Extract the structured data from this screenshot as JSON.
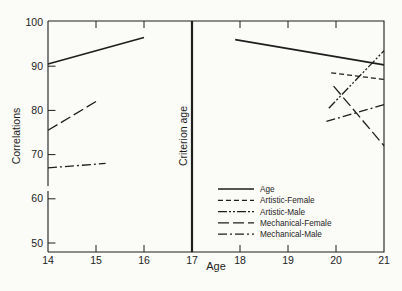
{
  "figure": {
    "background_color": "#fbfbf7",
    "line_color": "#1e1e1e"
  },
  "chart_data": {
    "type": "line",
    "title": "",
    "xlabel": "Age",
    "ylabel": "Correlations",
    "xlim": [
      14,
      21
    ],
    "ylim": [
      50,
      100
    ],
    "x_ticks": [
      14,
      15,
      16,
      17,
      18,
      19,
      20,
      21
    ],
    "y_ticks": [
      50,
      60,
      70,
      80,
      90,
      100
    ],
    "grid": false,
    "y_axis_break": true,
    "criterion_line": {
      "x": 17,
      "label": "Criterion age"
    },
    "legend": {
      "position": "inside-bottom-right",
      "entries": [
        "Age",
        "Artistic-Female",
        "Artistic-Male",
        "Mechanical-Female",
        "Mechanical-Male"
      ]
    },
    "series": [
      {
        "name": "Age",
        "line_style": "solid",
        "segments": [
          [
            [
              14,
              90.5
            ],
            [
              16,
              96.5
            ]
          ],
          [
            [
              17.9,
              96.0
            ],
            [
              21,
              90.3
            ]
          ]
        ]
      },
      {
        "name": "Artistic-Female",
        "line_style": "dashed",
        "segments": [
          [
            [
              19.9,
              88.5
            ],
            [
              21,
              87.0
            ]
          ]
        ]
      },
      {
        "name": "Artistic-Male",
        "line_style": "dash-dot-dot",
        "segments": [
          [
            [
              19.85,
              80.5
            ],
            [
              21,
              93.5
            ]
          ]
        ]
      },
      {
        "name": "Mechanical-Female",
        "line_style": "long-dash",
        "segments": [
          [
            [
              14,
              75.5
            ],
            [
              15,
              82.0
            ]
          ],
          [
            [
              19.95,
              85.5
            ],
            [
              21,
              72.0
            ]
          ]
        ]
      },
      {
        "name": "Mechanical-Male",
        "line_style": "dash-dot",
        "segments": [
          [
            [
              14,
              67.0
            ],
            [
              15.2,
              68.0
            ]
          ],
          [
            [
              19.8,
              77.5
            ],
            [
              21,
              81.3
            ]
          ]
        ]
      }
    ]
  }
}
